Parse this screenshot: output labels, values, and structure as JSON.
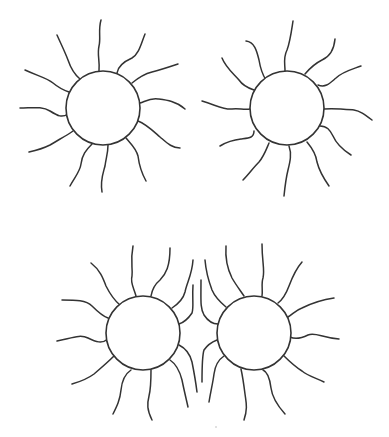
{
  "illustration": {
    "subject": "four suns line drawing",
    "background": "#ffffff",
    "stroke_color": "#333333",
    "suns": [
      {
        "name": "sun-top-left",
        "cx": 103,
        "cy": 108,
        "r": 37,
        "rays": [
          "M99 71 C100 60 97 55 99 46 C101 38 98 30 101 20",
          "M117 73 C118 66 123 62 132 58 C139 54 141 44 145 34",
          "M132 83 C138 78 144 74 152 72 C160 70 166 68 178 64",
          "M140 103 C146 101 150 98 158 99 C166 100 176 101 185 109",
          "M138 121 C146 124 152 130 160 137 C167 143 172 148 180 148",
          "M126 138 C131 144 136 148 138 156 C139 164 141 172 146 181",
          "M108 145 C108 153 106 158 105 166 C103 174 100 180 102 192",
          "M92 144 C86 150 82 155 81 164 C80 172 74 178 70 186",
          "M73 131 C66 136 58 140 50 145 C44 148 38 150 29 152",
          "M68 114 C62 118 58 116 50 111 C42 106 32 108 20 108",
          "M69 92 C63 90 59 88 53 83 C47 78 38 76 25 70",
          "M80 79 C74 74 71 69 68 60 C65 52 61 44 57 35"
        ]
      },
      {
        "name": "sun-top-right",
        "cx": 287,
        "cy": 108,
        "r": 37,
        "rays": [
          "M285 71 C285 63 283 58 287 50 C290 42 291 34 293 21",
          "M305 74 C310 68 316 63 322 60 C329 57 334 50 335 39",
          "M318 85 C326 88 330 83 336 78 C342 72 350 70 361 66",
          "M324 109 C333 108 343 109 354 110 C360 111 364 114 372 120",
          "M320 126 C327 126 330 130 333 136 C336 143 340 148 351 155",
          "M307 142 C312 148 316 154 317 162 C319 170 322 176 329 186",
          "M289 146 C292 154 290 162 288 170 C286 178 285 186 284 196",
          "M269 143 C266 150 264 156 259 162 C253 168 249 174 243 180",
          "M254 131 C254 138 249 138 241 139 C232 140 225 143 220 146",
          "M250 109 C244 110 238 108 232 109 C225 110 218 106 202 101",
          "M254 90 C248 88 243 86 239 80 C234 74 226 68 222 58",
          "M266 80 C262 74 260 66 259 60 C257 52 255 42 246 41"
        ]
      },
      {
        "name": "sun-bottom-left",
        "cx": 143,
        "cy": 333,
        "r": 37,
        "rays": [
          "M136 296 C134 288 130 283 132 276 C133 268 130 262 133 246",
          "M151 296 C152 290 154 285 160 280 C166 274 170 266 170 248",
          "M172 308 C178 304 183 300 185 292 C187 282 192 275 193 260",
          "M179 324 C185 322 188 319 192 313 C194 307 192 300 193 285",
          "M179 345 C185 348 190 354 192 362 C194 372 196 384 197 392",
          "M170 360 C176 364 180 372 182 380 C184 390 186 398 188 407",
          "M151 370 C151 380 151 388 149 396 C147 404 147 410 152 420",
          "M131 370 C125 374 122 380 121 390 C120 400 117 406 113 414",
          "M114 356 C108 362 101 368 94 374 C86 380 79 382 72 384",
          "M108 339 C102 344 96 342 88 338 C80 334 72 338 57 341",
          "M108 318 C102 316 98 312 92 306 C86 300 76 300 62 300",
          "M120 305 C114 300 110 294 106 286 C103 278 100 270 91 263"
        ]
      },
      {
        "name": "sun-bottom-right",
        "cx": 254,
        "cy": 333,
        "r": 37,
        "rays": [
          "M244 296 C240 290 236 285 232 278 C228 270 225 260 226 246",
          "M262 296 C263 290 261 284 263 278 C265 270 262 262 262 244",
          "M278 303 C282 300 286 294 289 286 C292 278 295 270 302 262",
          "M288 317 C293 314 296 310 302 308 C310 304 320 300 334 298",
          "M290 337 C296 340 302 338 308 335 C316 332 322 338 339 339",
          "M283 355 C288 360 294 366 302 371 C308 376 316 378 324 382",
          "M263 370 C268 372 270 380 271 388 C272 396 276 404 285 414",
          "M241 369 C243 378 244 386 245 394 C246 402 248 408 244 420",
          "M224 356 C218 360 215 366 214 374 C213 382 211 390 209 402",
          "M217 340 C212 342 208 344 204 350 C202 356 202 366 202 382",
          "M218 324 C213 324 208 321 204 315 C200 308 201 300 201 280",
          "M226 307 C220 302 215 297 212 290 C209 282 206 272 205 260"
        ]
      }
    ],
    "specks": [
      {
        "name": "scan-speck",
        "x": 216,
        "y": 427,
        "r": 0.8
      }
    ]
  }
}
